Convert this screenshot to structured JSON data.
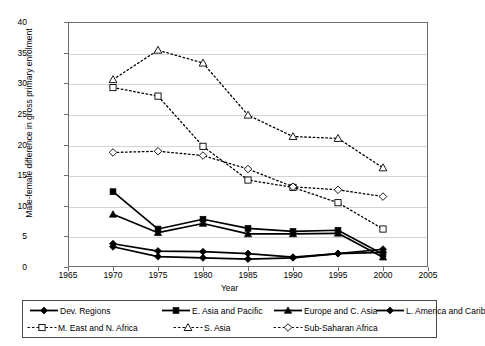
{
  "chart_data": {
    "type": "line",
    "title": "",
    "subtitle": "",
    "xlabel": "Year",
    "ylabel": "Male-female difference in gross primary enrolment",
    "x": [
      1970,
      1975,
      1980,
      1985,
      1990,
      1995,
      2000
    ],
    "xlim": [
      1965,
      2005
    ],
    "ylim": [
      0,
      40
    ],
    "xticks": [
      1965,
      1970,
      1975,
      1980,
      1985,
      1990,
      1995,
      2000,
      2005
    ],
    "yticks": [
      0,
      5,
      10,
      15,
      20,
      25,
      30,
      35,
      40
    ],
    "grid": "horizontal",
    "legend_position": "bottom",
    "series": [
      {
        "name": "Dev. Regions",
        "marker": "diamond-filled",
        "line": "solid",
        "values": [
          3.8,
          2.6,
          2.5,
          2.2,
          1.6,
          2.2,
          2.4
        ]
      },
      {
        "name": "E. Asia and Pacific",
        "marker": "square-filled",
        "line": "solid",
        "values": [
          12.3,
          6.2,
          7.8,
          6.3,
          5.8,
          6.0,
          2.1
        ]
      },
      {
        "name": "Europe and C. Asia",
        "marker": "triangle-filled",
        "line": "solid",
        "values": [
          8.6,
          5.6,
          7.1,
          5.4,
          5.4,
          5.5,
          1.6
        ]
      },
      {
        "name": "L. America and Carib",
        "marker": "diamond-filled",
        "line": "solid",
        "values": [
          3.3,
          1.7,
          1.5,
          1.3,
          1.5,
          2.2,
          2.9
        ]
      },
      {
        "name": "M. East and N. Africa",
        "marker": "square-hollow",
        "line": "dotted",
        "values": [
          29.3,
          27.9,
          19.7,
          14.2,
          13.0,
          10.5,
          6.2
        ]
      },
      {
        "name": "S. Asia",
        "marker": "triangle-hollow",
        "line": "dotted",
        "values": [
          30.6,
          35.4,
          33.3,
          24.8,
          21.3,
          21.0,
          16.2
        ]
      },
      {
        "name": "Sub-Saharan Africa",
        "marker": "diamond-hollow",
        "line": "dotted",
        "values": [
          18.7,
          18.9,
          18.2,
          16.0,
          13.1,
          12.6,
          11.5
        ]
      }
    ]
  },
  "legend": {
    "row1": [
      "Dev. Regions",
      "E. Asia and Pacific",
      "Europe and C. Asia",
      "L. America and Carib"
    ],
    "row2": [
      "M. East and N. Africa",
      "S. Asia",
      "Sub-Saharan Africa"
    ]
  },
  "colors": {
    "line": "#000000",
    "grid": "#d4d4d4",
    "frame": "#6e6e6e",
    "background": "#ffffff"
  }
}
